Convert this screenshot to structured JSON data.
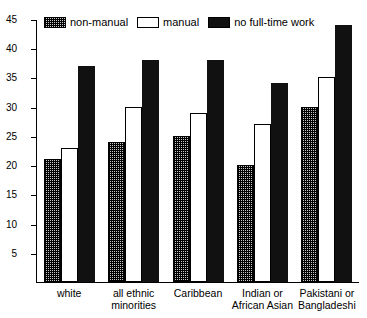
{
  "chart_data": {
    "type": "bar",
    "title": "",
    "subtitle": "",
    "xlabel": "",
    "ylabel": "",
    "ylim": [
      0,
      45
    ],
    "yticks": [
      5,
      10,
      15,
      20,
      25,
      30,
      35,
      40,
      45
    ],
    "grid": false,
    "legend_position": "top-left",
    "categories": [
      "white",
      "all ethnic\nminorities",
      "Caribbean",
      "Indian or\nAfrican Asian",
      "Pakistani or\nBangladeshi"
    ],
    "series": [
      {
        "name": "non-manual",
        "values": [
          21,
          24,
          25,
          20,
          30
        ],
        "color": "#c8c8c8",
        "pattern": "checked-hatch"
      },
      {
        "name": "manual",
        "values": [
          23,
          30,
          29,
          27,
          35
        ],
        "color": "#ffffff",
        "pattern": "outline"
      },
      {
        "name": "no full-time work",
        "values": [
          37,
          38,
          38,
          34,
          44
        ],
        "color": "#111111",
        "pattern": "solid"
      }
    ]
  },
  "legend": {
    "items": [
      {
        "label": "non-manual"
      },
      {
        "label": "manual"
      },
      {
        "label": "no full-time work"
      }
    ]
  },
  "axis": {
    "y_tick_labels": [
      "45",
      "40",
      "35",
      "30",
      "25",
      "20",
      "15",
      "10",
      "5"
    ]
  }
}
